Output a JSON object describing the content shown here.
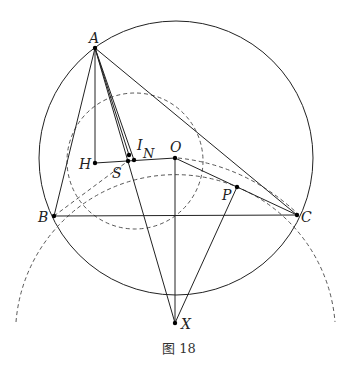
{
  "figure": {
    "caption": "图 18",
    "points": [
      {
        "id": "A",
        "label": "A"
      },
      {
        "id": "B",
        "label": "B"
      },
      {
        "id": "C",
        "label": "C"
      },
      {
        "id": "H",
        "label": "H"
      },
      {
        "id": "S",
        "label": "S"
      },
      {
        "id": "I",
        "label": "I"
      },
      {
        "id": "N",
        "label": "N"
      },
      {
        "id": "O",
        "label": "O"
      },
      {
        "id": "P",
        "label": "P"
      },
      {
        "id": "X",
        "label": "X"
      }
    ],
    "segments_solid": [
      "A-B",
      "A-C",
      "B-C",
      "A-H",
      "H-S",
      "S-O",
      "A-S",
      "A-I",
      "A-N",
      "A-X",
      "O-X",
      "O-C",
      "P-X"
    ],
    "segments_dashed": [
      "B-S",
      "O-C"
    ],
    "circles": [
      {
        "name": "circumcircle",
        "style": "solid"
      },
      {
        "name": "nine-point-circle",
        "style": "dashed"
      },
      {
        "name": "arc-through-B-C",
        "style": "dashed"
      }
    ]
  }
}
